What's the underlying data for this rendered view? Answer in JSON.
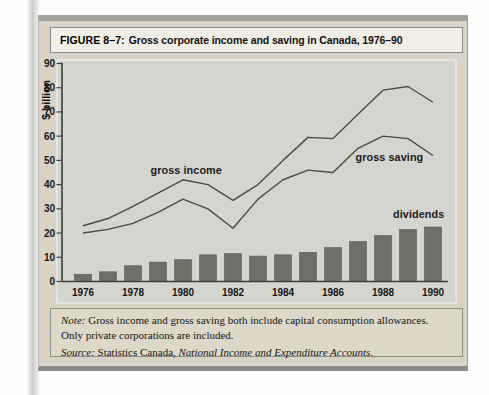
{
  "figure": {
    "label": "FIGURE 8–7:",
    "title": "Gross corporate income and saving in Canada, 1976–90"
  },
  "chart_data": {
    "type": "line+bar",
    "x": [
      1976,
      1977,
      1978,
      1979,
      1980,
      1981,
      1982,
      1983,
      1984,
      1985,
      1986,
      1987,
      1988,
      1989,
      1990
    ],
    "series": [
      {
        "name": "gross income",
        "type": "line",
        "values": [
          23,
          26,
          31,
          36.5,
          42,
          40,
          33.5,
          40,
          50,
          59.5,
          59,
          69,
          79,
          80.5,
          74
        ]
      },
      {
        "name": "gross saving",
        "type": "line",
        "values": [
          20,
          21.5,
          24,
          28.5,
          34,
          30,
          22,
          34,
          42,
          46,
          45,
          55,
          60,
          59,
          52
        ]
      },
      {
        "name": "dividends",
        "type": "bar",
        "values": [
          3,
          4,
          6.5,
          8,
          9,
          11,
          11.5,
          10.5,
          11,
          12,
          14,
          16.5,
          19,
          21.5,
          22.5
        ]
      }
    ],
    "title": "Gross corporate income and saving in Canada, 1976–90",
    "xlabel": "",
    "ylabel": "$ billion",
    "ylim": [
      0,
      90
    ],
    "ytick_step": 10,
    "xticks": [
      1976,
      1978,
      1980,
      1982,
      1984,
      1986,
      1988,
      1990
    ],
    "grid": false,
    "legend_position": "none",
    "annotations": [
      {
        "text": "gross income",
        "year": 1978.7,
        "value": 46,
        "anchor": "start"
      },
      {
        "text": "gross saving",
        "year": 1986.9,
        "value": 51,
        "anchor": "start"
      },
      {
        "text": "dividends",
        "year": 1988.4,
        "value": 27.5,
        "anchor": "start"
      }
    ]
  },
  "note": {
    "note_label": "Note:",
    "note_text": " Gross income and gross saving both include capital consumption allowances. Only private corporations are included.",
    "source_label": "Source:",
    "source_text": " Statistics Canada, ",
    "source_title": "National Income and Expenditure Accounts",
    "source_end": "."
  },
  "colors": {
    "figure_bg": "#d8d3c5",
    "panel_bg": "#d5d5cf",
    "panel_border": "#ecebe3",
    "bar": "#6f6f68",
    "bar_edge": "#5b5b55",
    "line": "#4a4a46",
    "axis": "#3f3f3c",
    "text": "#161616"
  }
}
